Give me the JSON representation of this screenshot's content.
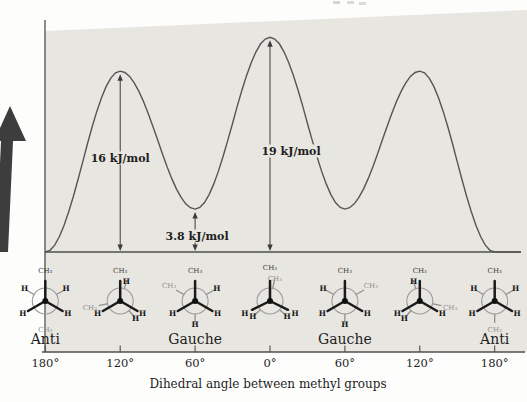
{
  "colors": {
    "plot_bg": "#e8e6e1",
    "line_ink": "#4f4f4f",
    "curve_ink": "#555555",
    "text_ink": "#1e1e1e",
    "back_ink": "#8f8f8f",
    "front_ink": "#1a1a1a",
    "arrow_ink": "#3d3d3d",
    "page_bg": "#fdfdfc"
  },
  "chart_data": {
    "type": "line",
    "title": "",
    "xlabel": "Dihedral angle between methyl groups",
    "ylabel": "",
    "y_unit": "kJ/mol",
    "grid": false,
    "x_tick_labels": [
      "180°",
      "120°",
      "60°",
      "0°",
      "60°",
      "120°",
      "180°"
    ],
    "x_tick_degrees": [
      -180,
      -120,
      -60,
      0,
      60,
      120,
      180
    ],
    "profile_extrema": [
      {
        "deg": -180,
        "kjmol": 0
      },
      {
        "deg": -120,
        "kjmol": 16
      },
      {
        "deg": -60,
        "kjmol": 3.8
      },
      {
        "deg": 0,
        "kjmol": 19
      },
      {
        "deg": 60,
        "kjmol": 3.8
      },
      {
        "deg": 120,
        "kjmol": 16
      },
      {
        "deg": 180,
        "kjmol": 0
      }
    ],
    "annotations": [
      {
        "label": "16 kJ/mol",
        "deg": -120,
        "kjmol": 16
      },
      {
        "label": "19 kJ/mol",
        "deg": 0,
        "kjmol": 19
      },
      {
        "label": "3.8 kJ/mol",
        "deg": -60,
        "kjmol": 3.8
      }
    ],
    "conformation_labels": [
      {
        "deg": -180,
        "label": "Anti"
      },
      {
        "deg": -60,
        "label": "Gauche"
      },
      {
        "deg": 60,
        "label": "Gauche"
      },
      {
        "deg": 180,
        "label": "Anti"
      }
    ]
  },
  "conformations": [
    {
      "deg": -180,
      "name": "anti",
      "front": [
        {
          "angle": 0,
          "label": "CH₃"
        },
        {
          "angle": 120,
          "label": "H"
        },
        {
          "angle": 240,
          "label": "H"
        }
      ],
      "back": [
        {
          "angle": 60,
          "label": "H",
          "r": 24
        },
        {
          "angle": 300,
          "label": "H",
          "r": 24
        },
        {
          "angle": 180,
          "label": "CH₃",
          "r": 29
        }
      ]
    },
    {
      "deg": -120,
      "name": "eclipsed",
      "front": [
        {
          "angle": 0,
          "label": "CH₃"
        },
        {
          "angle": 120,
          "label": "H"
        },
        {
          "angle": 240,
          "label": "H"
        }
      ],
      "back": [
        {
          "angle": 18,
          "label": "H",
          "r": 20
        },
        {
          "angle": 138,
          "label": "H",
          "r": 23
        },
        {
          "angle": 258,
          "label": "CH₃",
          "r": 31
        }
      ]
    },
    {
      "deg": -60,
      "name": "gauche",
      "front": [
        {
          "angle": 0,
          "label": "CH₃"
        },
        {
          "angle": 120,
          "label": "H"
        },
        {
          "angle": 240,
          "label": "H"
        }
      ],
      "back": [
        {
          "angle": 300,
          "label": "CH₃",
          "r": 30
        },
        {
          "angle": 60,
          "label": "H",
          "r": 25
        },
        {
          "angle": 180,
          "label": "H",
          "r": 24
        }
      ]
    },
    {
      "deg": 0,
      "name": "fully-eclipsed",
      "front": [
        {
          "angle": 0,
          "label": "CH₃",
          "r": 33
        },
        {
          "angle": 116,
          "label": "H",
          "r": 28
        },
        {
          "angle": 244,
          "label": "H",
          "r": 28
        }
      ],
      "back": [
        {
          "angle": 12,
          "label": "CH₃",
          "r": 23
        },
        {
          "angle": 132,
          "label": "H",
          "r": 23
        },
        {
          "angle": 228,
          "label": "H",
          "r": 23
        }
      ]
    },
    {
      "deg": 60,
      "name": "gauche",
      "front": [
        {
          "angle": 0,
          "label": "CH₃"
        },
        {
          "angle": 120,
          "label": "H"
        },
        {
          "angle": 240,
          "label": "H"
        }
      ],
      "back": [
        {
          "angle": 60,
          "label": "CH₃",
          "r": 30
        },
        {
          "angle": 300,
          "label": "H",
          "r": 25
        },
        {
          "angle": 180,
          "label": "H",
          "r": 24
        }
      ]
    },
    {
      "deg": 120,
      "name": "eclipsed",
      "front": [
        {
          "angle": 0,
          "label": "CH₃"
        },
        {
          "angle": 120,
          "label": "H"
        },
        {
          "angle": 240,
          "label": "H"
        }
      ],
      "back": [
        {
          "angle": 342,
          "label": "H",
          "r": 20
        },
        {
          "angle": 222,
          "label": "H",
          "r": 23
        },
        {
          "angle": 102,
          "label": "CH₃",
          "r": 31
        }
      ]
    },
    {
      "deg": 180,
      "name": "anti",
      "front": [
        {
          "angle": 0,
          "label": "CH₃"
        },
        {
          "angle": 120,
          "label": "H"
        },
        {
          "angle": 240,
          "label": "H"
        }
      ],
      "back": [
        {
          "angle": 60,
          "label": "H",
          "r": 24
        },
        {
          "angle": 300,
          "label": "H",
          "r": 24
        },
        {
          "angle": 180,
          "label": "CH₃",
          "r": 29
        }
      ]
    }
  ]
}
